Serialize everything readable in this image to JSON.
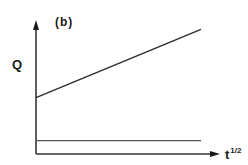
{
  "chart_data": {
    "type": "line",
    "title": "(b)",
    "xlabel": "t^1/2",
    "xlabel_base": "t",
    "xlabel_exponent": "1/2",
    "ylabel": "Q",
    "grid": false,
    "legend": null,
    "axis_ticks": "none",
    "series": [
      {
        "name": "increasing line",
        "x": [
          0,
          1
        ],
        "y": [
          0.42,
          0.93
        ],
        "color": "#2a2a2a"
      },
      {
        "name": "flat baseline",
        "x": [
          0,
          1
        ],
        "y": [
          0.1,
          0.1
        ],
        "color": "#555555"
      }
    ],
    "xlim": [
      0,
      1.1
    ],
    "ylim": [
      0,
      1.0
    ]
  },
  "labels": {
    "panel": "(b)",
    "y_axis": "Q",
    "x_axis_base": "t",
    "x_axis_exp": "1/2"
  }
}
